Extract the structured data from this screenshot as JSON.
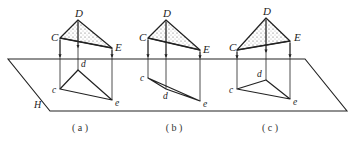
{
  "plane": {
    "label": "H",
    "points": [
      [
        8,
        59
      ],
      [
        305,
        59
      ],
      [
        347,
        111
      ],
      [
        50,
        111
      ]
    ]
  },
  "figures": [
    {
      "caption": "( a )",
      "caption_pos": [
        80,
        131
      ],
      "space": {
        "C": [
          60,
          38
        ],
        "D": [
          78,
          20
        ],
        "E": [
          112,
          48
        ]
      },
      "proj": {
        "c": [
          60,
          89
        ],
        "d": [
          78,
          70
        ],
        "e": [
          112,
          100
        ]
      },
      "labels": {
        "C": "C",
        "D": "D",
        "E": "E",
        "c": "c",
        "d": "d",
        "e": "e"
      }
    },
    {
      "caption": "( b )",
      "caption_pos": [
        174,
        131
      ],
      "space": {
        "C": [
          148,
          38
        ],
        "D": [
          166,
          20
        ],
        "E": [
          200,
          50
        ]
      },
      "proj": {
        "c": [
          148,
          78
        ],
        "d": [
          166,
          89
        ],
        "e": [
          200,
          101
        ]
      },
      "labels": {
        "C": "C",
        "D": "D",
        "E": "E",
        "c": "c",
        "d": "d",
        "e": "e"
      }
    },
    {
      "caption": "( c )",
      "caption_pos": [
        270,
        131
      ],
      "space": {
        "C": [
          237,
          50
        ],
        "D": [
          266,
          18
        ],
        "E": [
          290,
          41
        ]
      },
      "proj": {
        "c": [
          237,
          89
        ],
        "d": [
          266,
          80
        ],
        "e": [
          290,
          99
        ]
      },
      "labels": {
        "C": "C",
        "D": "D",
        "E": "E",
        "c": "c",
        "d": "d",
        "e": "e"
      }
    }
  ],
  "colors": {
    "line": "#222222",
    "fill": "#ffffff",
    "dots": "#444444"
  }
}
